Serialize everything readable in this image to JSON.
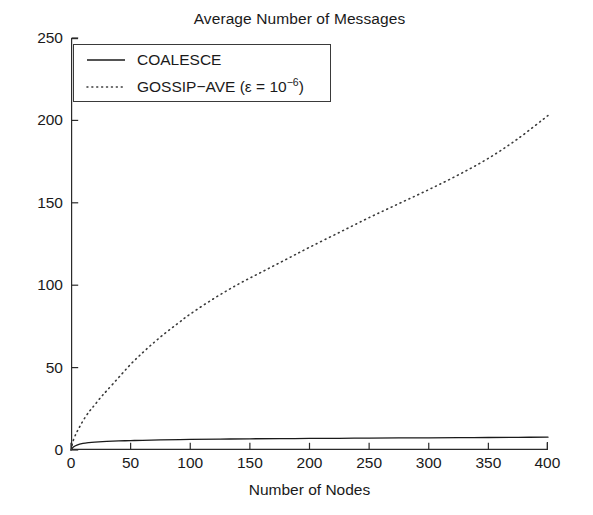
{
  "chart_data": {
    "type": "line",
    "title": "Average Number of Messages",
    "xlabel": "Number of Nodes",
    "ylabel": "",
    "xlim": [
      0,
      400
    ],
    "ylim": [
      0,
      250
    ],
    "xticks": [
      0,
      50,
      100,
      150,
      200,
      250,
      300,
      350,
      400
    ],
    "xtick_labels": [
      "0",
      "50",
      "100",
      "150",
      "200",
      "250",
      "300",
      "350",
      "400"
    ],
    "yticks": [
      0,
      50,
      100,
      150,
      200,
      250
    ],
    "ytick_labels": [
      "0",
      "50",
      "100",
      "150",
      "200",
      "250"
    ],
    "grid": false,
    "legend_position": "upper left",
    "series": [
      {
        "name": "COALESCE",
        "legend_label": "COALESCE",
        "style": "solid",
        "color": "#1a1a1a",
        "x": [
          0,
          2,
          5,
          10,
          15,
          20,
          30,
          40,
          50,
          60,
          75,
          100,
          125,
          150,
          175,
          200,
          225,
          250,
          275,
          300,
          325,
          350,
          375,
          400
        ],
        "values": [
          0.0,
          1.8,
          3.0,
          4.0,
          4.5,
          4.8,
          5.2,
          5.5,
          5.7,
          5.9,
          6.1,
          6.4,
          6.6,
          6.8,
          6.9,
          7.0,
          7.1,
          7.2,
          7.3,
          7.4,
          7.5,
          7.6,
          7.7,
          7.8
        ]
      },
      {
        "name": "GOSSIP-AVE",
        "legend_label_prefix": "GOSSIP−AVE (ε = 10",
        "legend_label_exponent": "−6",
        "legend_label_suffix": ")",
        "style": "dotted",
        "color": "#3a3a3a",
        "x": [
          0,
          2,
          5,
          8,
          12,
          16,
          20,
          25,
          30,
          40,
          50,
          60,
          70,
          80,
          90,
          100,
          120,
          140,
          160,
          180,
          200,
          225,
          250,
          275,
          300,
          325,
          350,
          375,
          400
        ],
        "values": [
          0.0,
          6.0,
          11.0,
          15.0,
          20.0,
          24.0,
          27.5,
          32.0,
          36.0,
          44.0,
          52.0,
          59.0,
          65.5,
          71.5,
          77.0,
          82.5,
          92.0,
          100.5,
          108.0,
          115.5,
          123.0,
          132.0,
          141.0,
          149.5,
          158.0,
          167.0,
          177.0,
          189.0,
          203.0
        ]
      }
    ]
  },
  "figure": {
    "title": "Average Number of Messages",
    "xaxis_label": "Number of Nodes"
  },
  "legend": {
    "items": [
      {
        "label": "COALESCE",
        "sample": "solid-line-sample"
      },
      {
        "label_prefix": "GOSSIP−AVE (ε = 10",
        "label_exponent": "−6",
        "label_suffix": ")",
        "sample": "dotted-line-sample"
      }
    ]
  },
  "axes": {
    "y_labels": [
      "250",
      "200",
      "150",
      "100",
      "50",
      "0"
    ],
    "x_labels": [
      "0",
      "50",
      "100",
      "150",
      "200",
      "250",
      "300",
      "350",
      "400"
    ]
  }
}
